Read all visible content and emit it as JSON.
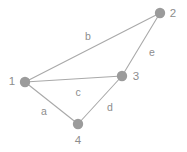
{
  "figure": {
    "kind": "undirected-graph-diagram",
    "background_color": "#ffffff",
    "node_color": "#9b9b9b",
    "edge_color": "#a9a9a9",
    "label_color": "#8d8d8d"
  },
  "chart_data": {
    "type": "diagram",
    "title": "",
    "nodes": [
      {
        "id": "1",
        "label": "1",
        "x": 25,
        "y": 82,
        "r": 5.2,
        "label_x": 12,
        "label_y": 82
      },
      {
        "id": "2",
        "label": "2",
        "x": 160,
        "y": 13,
        "r": 5.2,
        "label_x": 173,
        "label_y": 14
      },
      {
        "id": "3",
        "label": "3",
        "x": 122,
        "y": 76,
        "r": 5.2,
        "label_x": 136,
        "label_y": 77
      },
      {
        "id": "4",
        "label": "4",
        "x": 78,
        "y": 124,
        "r": 5.2,
        "label_x": 78,
        "label_y": 141
      }
    ],
    "edges": [
      {
        "id": "a",
        "label": "a",
        "from": "1",
        "to": "4",
        "x1": 25,
        "y1": 82,
        "x2": 78,
        "y2": 124,
        "label_x": 44,
        "label_y": 112
      },
      {
        "id": "b",
        "label": "b",
        "from": "1",
        "to": "2",
        "x1": 25,
        "y1": 82,
        "x2": 160,
        "y2": 13,
        "label_x": 88,
        "label_y": 37
      },
      {
        "id": "c",
        "label": "c",
        "from": "1",
        "to": "3",
        "x1": 25,
        "y1": 82,
        "x2": 122,
        "y2": 76,
        "label_x": 78,
        "label_y": 93
      },
      {
        "id": "d",
        "label": "d",
        "from": "3",
        "to": "4",
        "x1": 122,
        "y1": 76,
        "x2": 78,
        "y2": 124,
        "label_x": 110,
        "label_y": 108
      },
      {
        "id": "e",
        "label": "e",
        "from": "2",
        "to": "3",
        "x1": 160,
        "y1": 13,
        "x2": 122,
        "y2": 76,
        "label_x": 152,
        "label_y": 53
      }
    ]
  }
}
